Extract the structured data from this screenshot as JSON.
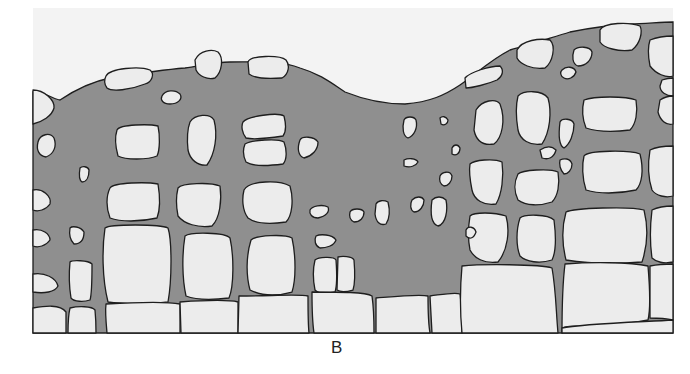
{
  "figure": {
    "panel_label": "B",
    "colors": {
      "background": "#ffffff",
      "frame_fill": "#f2f2f2",
      "matrix": "#8f8f8f",
      "block": "#ececec",
      "outline": "#1e1e1e"
    }
  }
}
